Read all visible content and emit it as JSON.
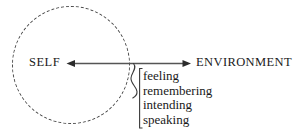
{
  "diagram": {
    "background_color": "#ffffff",
    "stroke_color": "#4a4a4a",
    "text_color": "#1a1a1a",
    "self": {
      "label": "SELF",
      "boundary": "dashed-circle"
    },
    "environment": {
      "label": "ENVIRONMENT"
    },
    "axis": {
      "type": "double-headed-arrow",
      "left_arrow": "arrowhead-left",
      "right_arrow": "arrowhead-right"
    },
    "brace": {
      "glyph": "curly-brace",
      "bracket": "vertical-bar"
    },
    "processes": [
      {
        "label": "feeling"
      },
      {
        "label": "remembering"
      },
      {
        "label": "intending"
      },
      {
        "label": "speaking"
      }
    ]
  }
}
